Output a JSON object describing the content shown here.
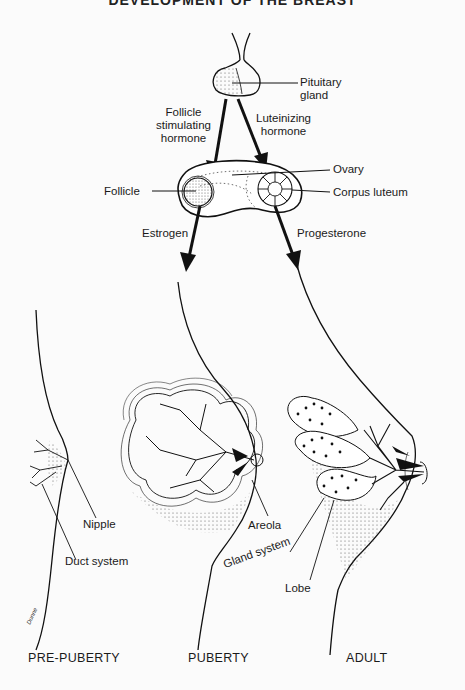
{
  "title": "DEVELOPMENT OF THE BREAST",
  "hormones": {
    "pituitary": "Pituitary gland",
    "pituitary_l1": "Pituitary",
    "pituitary_l2": "gland",
    "fsh_l1": "Follicle",
    "fsh_l2": "stimulating",
    "fsh_l3": "hormone",
    "lh_l1": "Luteinizing",
    "lh_l2": "hormone",
    "ovary": "Ovary",
    "follicle": "Follicle",
    "corpus_luteum": "Corpus luteum",
    "estrogen": "Estrogen",
    "progesterone": "Progesterone"
  },
  "anatomy": {
    "nipple": "Nipple",
    "duct_system": "Duct system",
    "areola": "Areola",
    "gland_system": "Gland system",
    "lobe": "Lobe"
  },
  "stages": [
    "PRE-PUBERTY",
    "PUBERTY",
    "ADULT"
  ],
  "colors": {
    "ink": "#111111",
    "background": "#fbfbfb",
    "stipple": "#555555"
  }
}
